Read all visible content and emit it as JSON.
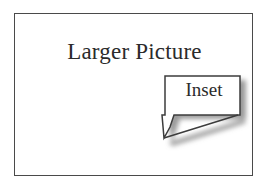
{
  "figure": {
    "title": "Larger Picture",
    "inset_label": "Inset",
    "colors": {
      "background": "#ffffff",
      "frame_stroke": "#4a4a4a",
      "callout_stroke": "#3c3c3c",
      "callout_fill": "#ffffff",
      "shadow": "#9a9a9a",
      "text": "#2b2b2b"
    }
  }
}
